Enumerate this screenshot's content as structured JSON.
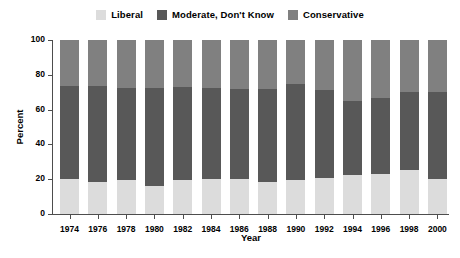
{
  "legend": {
    "position": "top-center",
    "entries": [
      {
        "label": "Liberal",
        "color": "#dcdcdc",
        "swatch_name": "legend-swatch-liberal"
      },
      {
        "label": "Moderate, Don't Know",
        "color": "#585858",
        "swatch_name": "legend-swatch-moderate"
      },
      {
        "label": "Conservative",
        "color": "#808080",
        "swatch_name": "legend-swatch-conservative"
      }
    ]
  },
  "axes": {
    "ylabel": "Percent",
    "xlabel": "Year",
    "yticks": [
      "0",
      "20",
      "40",
      "60",
      "80",
      "100"
    ],
    "ylim": [
      0,
      100
    ],
    "grid": false
  },
  "chart_data": {
    "type": "bar",
    "subtype": "stacked-bar-100-percent",
    "title": "",
    "xlabel": "Year",
    "ylabel": "Percent",
    "ylim": [
      0,
      100
    ],
    "grid": false,
    "legend_position": "top-center",
    "categories": [
      "1974",
      "1976",
      "1978",
      "1980",
      "1982",
      "1984",
      "1986",
      "1988",
      "1990",
      "1992",
      "1994",
      "1996",
      "1998",
      "2000"
    ],
    "series": [
      {
        "name": "Liberal",
        "color": "#dcdcdc",
        "values": [
          20,
          18.5,
          19.5,
          16,
          19.5,
          20,
          20,
          18.5,
          19.5,
          20.5,
          22.5,
          23,
          25.5,
          20
        ]
      },
      {
        "name": "Moderate, Don't Know",
        "color": "#585858",
        "values": [
          53.5,
          55,
          53,
          56.5,
          53.5,
          52.5,
          52,
          53.5,
          55.5,
          50.5,
          42.5,
          43.5,
          44.5,
          50
        ]
      },
      {
        "name": "Conservative",
        "color": "#808080",
        "values": [
          26.5,
          26.5,
          27.5,
          27.5,
          27,
          27.5,
          28,
          28,
          25,
          29,
          35,
          33.5,
          30,
          30
        ]
      }
    ],
    "cumulative_tops": {
      "liberal": [
        20,
        18.5,
        19.5,
        16,
        19.5,
        20,
        20,
        18.5,
        19.5,
        20.5,
        22.5,
        23,
        25.5,
        20
      ],
      "liberal_plus_moderate": [
        73.5,
        73.5,
        72.5,
        72.5,
        73,
        72.5,
        72,
        72,
        75,
        71,
        65,
        66.5,
        70,
        70
      ]
    }
  }
}
